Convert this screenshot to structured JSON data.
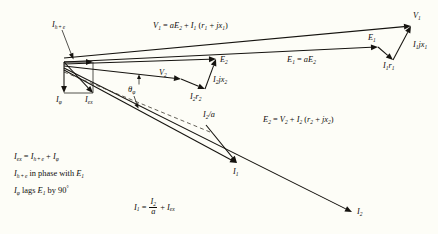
{
  "figure": {
    "kind": "phasor-diagram",
    "background_color": "#fdfdf7",
    "ink_color": "#15130f",
    "width": 438,
    "height": 234
  },
  "chart_data": {
    "type": "scatter",
    "xlabel": "",
    "ylabel": "",
    "xlim": [
      0,
      438
    ],
    "ylim": [
      234,
      0
    ],
    "grid": false,
    "legend": "none",
    "note": "Vector (phasor) diagram. Coordinates are in screen pixels; y increases downward.",
    "origin": {
      "x": 64,
      "y": 62
    },
    "vectors": [
      {
        "name": "I_h+e",
        "label": "I_h+e",
        "x1": 64,
        "y1": 62,
        "x2": 93,
        "y2": 62,
        "style": "solid"
      },
      {
        "name": "I_phi",
        "label": "I_phi",
        "x1": 64,
        "y1": 62,
        "x2": 64,
        "y2": 93,
        "style": "solid"
      },
      {
        "name": "I_ex",
        "label": "I_ex",
        "x1": 64,
        "y1": 62,
        "x2": 93,
        "y2": 93,
        "style": "solid"
      },
      {
        "name": "V_1",
        "label": "V_1",
        "x1": 64,
        "y1": 58,
        "x2": 411,
        "y2": 26,
        "style": "solid"
      },
      {
        "name": "E_1",
        "label": "E_1",
        "x1": 64,
        "y1": 62,
        "x2": 378,
        "y2": 47,
        "style": "solid"
      },
      {
        "name": "I_1r_1",
        "label": "I_1r_1",
        "x1": 378,
        "y1": 47,
        "x2": 393,
        "y2": 60,
        "style": "solid"
      },
      {
        "name": "I_1jx_1",
        "label": "I_1jx_1",
        "x1": 393,
        "y1": 60,
        "x2": 411,
        "y2": 26,
        "style": "solid"
      },
      {
        "name": "E_2",
        "label": "E_2",
        "x1": 64,
        "y1": 64,
        "x2": 216,
        "y2": 59,
        "style": "solid"
      },
      {
        "name": "V_2",
        "label": "V_2",
        "x1": 64,
        "y1": 66,
        "x2": 181,
        "y2": 79,
        "style": "solid"
      },
      {
        "name": "I_2r_2",
        "label": "I_2r_2",
        "x1": 181,
        "y1": 79,
        "x2": 205,
        "y2": 89,
        "style": "solid"
      },
      {
        "name": "I_2jx_2",
        "label": "I_2jx_2",
        "x1": 205,
        "y1": 89,
        "x2": 216,
        "y2": 59,
        "style": "solid"
      },
      {
        "name": "I_2",
        "label": "I_2",
        "x1": 64,
        "y1": 68,
        "x2": 352,
        "y2": 212,
        "style": "solid"
      },
      {
        "name": "I_1_res",
        "label": "I_1",
        "x1": 64,
        "y1": 70,
        "x2": 237,
        "y2": 163,
        "style": "solid"
      },
      {
        "name": "I_2_over_a",
        "label": "I_2/a",
        "x1": 206,
        "y1": 125,
        "x2": 237,
        "y2": 163,
        "style": "solid"
      },
      {
        "name": "I_ex_ref",
        "label": "I_ex reference",
        "x1": 64,
        "y1": 72,
        "x2": 210,
        "y2": 132,
        "style": "dashed"
      }
    ],
    "construction_lines": [
      {
        "name": "I_phi-to-I_ex tick",
        "x1": 64,
        "y1": 93,
        "x2": 93,
        "y2": 93
      },
      {
        "name": "I_h+e-to-I_ex tick",
        "x1": 93,
        "y1": 62,
        "x2": 93,
        "y2": 93
      }
    ],
    "angle_marks": [
      {
        "name": "theta-phi",
        "label": "θ_φ",
        "vertex_x": 64,
        "vertex_y": 62,
        "x": 133,
        "y": 91
      }
    ]
  },
  "labels": {
    "v1_tip": {
      "main": "V",
      "sub": "1"
    },
    "e1_vec": {
      "main": "E",
      "sub": "1"
    },
    "i1r1": {
      "main": "I",
      "sub": "1",
      "main2": "r",
      "sub2": "1"
    },
    "i1jx1": {
      "main": "I",
      "sub": "1",
      "main2": "jx",
      "sub2": "1"
    },
    "e2_vec": {
      "main": "E",
      "sub": "2"
    },
    "v2_vec": {
      "main": "V",
      "sub": "2"
    },
    "i2r2": {
      "main": "I",
      "sub": "2",
      "main2": "r",
      "sub2": "2"
    },
    "i2jx2": {
      "main": "I",
      "sub": "2",
      "main2": "jx",
      "sub2": "2"
    },
    "i2_tip": {
      "main": "I",
      "sub": "2"
    },
    "i1_tip": {
      "main": "I",
      "sub": "1"
    },
    "i2_over_a": {
      "main": "I",
      "sub": "2",
      "tail": "/a"
    },
    "ihe": {
      "main": "I",
      "sub": "h+e"
    },
    "iphi": {
      "main": "I",
      "sub": "φ"
    },
    "iex": {
      "main": "I",
      "sub": "ex"
    },
    "theta": {
      "main": "θ",
      "sub": "φ"
    }
  },
  "equations": {
    "v1": {
      "id": "eq-v1",
      "text": "V₁ = aE₂ + I₁ (r₁ + jx₁)",
      "parts": [
        "V",
        "1",
        " = a",
        "E",
        "2",
        " + ",
        "I",
        "1",
        " (",
        "r",
        "1",
        " + j",
        "x",
        "1",
        ")"
      ]
    },
    "e1": {
      "id": "eq-e1",
      "text": "E₁ = aE₂"
    },
    "e2": {
      "id": "eq-e2",
      "text": "E₂ = V₂ + I₂ (r₂ + jx₂)"
    },
    "i1": {
      "id": "eq-i1",
      "text": "I₁ = I₂/a + I_ex",
      "numerator": "I₂",
      "denominator": "a"
    }
  },
  "notes": [
    {
      "id": "note-iex",
      "text": "I_ex = I_h+e + I_φ"
    },
    {
      "id": "note-ihe",
      "text": "I_h+e in phase with E₁"
    },
    {
      "id": "note-iphi",
      "text": "I_φ lags E₁ by 90°"
    }
  ]
}
